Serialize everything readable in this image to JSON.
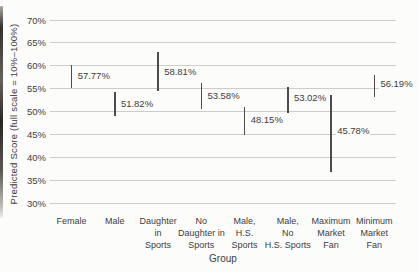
{
  "chart_data": {
    "type": "errorbar",
    "title": "",
    "xlabel": "Group",
    "ylabel": "Predicted Score (full scale = 10%–100%)",
    "ylim": [
      30,
      70
    ],
    "grid": true,
    "legend": "none",
    "y_ticks": [
      "70%",
      "65%",
      "60%",
      "55%",
      "50%",
      "45%",
      "40%",
      "35%",
      "30%"
    ],
    "groups": [
      {
        "label": "Female",
        "label_lines": [
          "Female"
        ],
        "value": 57.77,
        "value_label": "57.77%",
        "ci_low": 55.2,
        "ci_high": 60.2
      },
      {
        "label": "Male",
        "label_lines": [
          "Male"
        ],
        "value": 51.82,
        "value_label": "51.82%",
        "ci_low": 49.0,
        "ci_high": 54.2
      },
      {
        "label": "Daughter in Sports",
        "label_lines": [
          "Daughter",
          "in",
          "Sports"
        ],
        "value": 58.81,
        "value_label": "58.81%",
        "ci_low": 54.5,
        "ci_high": 63.0
      },
      {
        "label": "No Daughter in Sports",
        "label_lines": [
          "No",
          "Daughter in",
          "Sports"
        ],
        "value": 53.58,
        "value_label": "53.58%",
        "ci_low": 50.6,
        "ci_high": 56.3
      },
      {
        "label": "Male, H.S. Sports",
        "label_lines": [
          "Male,",
          "H.S.",
          "Sports"
        ],
        "value": 48.15,
        "value_label": "48.15%",
        "ci_low": 44.9,
        "ci_high": 50.9
      },
      {
        "label": "Male, No H.S. Sports",
        "label_lines": [
          "Male,",
          "No",
          "H.S. Sports"
        ],
        "value": 53.02,
        "value_label": "53.02%",
        "ci_low": 49.7,
        "ci_high": 55.4
      },
      {
        "label": "Maximum Market Fan",
        "label_lines": [
          "Maximum",
          "Market",
          "Fan"
        ],
        "value": 45.78,
        "value_label": "45.78%",
        "ci_low": 36.8,
        "ci_high": 53.6
      },
      {
        "label": "Minimum Market Fan",
        "label_lines": [
          "Minimum",
          "Market",
          "Fan"
        ],
        "value": 56.19,
        "value_label": "56.19%",
        "ci_low": 53.2,
        "ci_high": 58.0
      }
    ],
    "colors": {
      "text": "#3d3d3d",
      "gridline": "#cdcdcd",
      "bar": "#4c4c4c",
      "background": "#fcfcfb"
    }
  }
}
